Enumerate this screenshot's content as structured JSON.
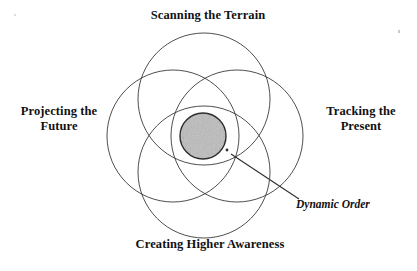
{
  "diagram": {
    "type": "venn",
    "background_color": "#ffffff",
    "stroke_color": "#3a3a3a",
    "center_fill_color": "#b4b4b4",
    "text_color": "#111111",
    "labels": {
      "top": "Scanning the Terrain",
      "left": "Projecting the\nFuture",
      "right": "Tracking the\nPresent",
      "bottom": "Creating Higher Awareness",
      "center_callout": "Dynamic Order"
    },
    "circles": [
      {
        "name": "scanning-the-terrain",
        "cx": 204,
        "cy": 99,
        "r": 66
      },
      {
        "name": "projecting-the-future",
        "cx": 173,
        "cy": 136,
        "r": 66
      },
      {
        "name": "tracking-the-present",
        "cx": 237,
        "cy": 136,
        "r": 66
      },
      {
        "name": "creating-higher-awareness",
        "cx": 204,
        "cy": 172,
        "r": 66
      }
    ],
    "center_region": {
      "name": "dynamic-order-region",
      "cx": 203,
      "cy": 136,
      "rx": 23,
      "ry": 23
    },
    "leader_line": {
      "from_x": 231,
      "from_y": 154,
      "to_x": 299,
      "to_y": 199
    },
    "leader_dot": {
      "x": 227,
      "y": 150,
      "r": 1.4
    }
  }
}
